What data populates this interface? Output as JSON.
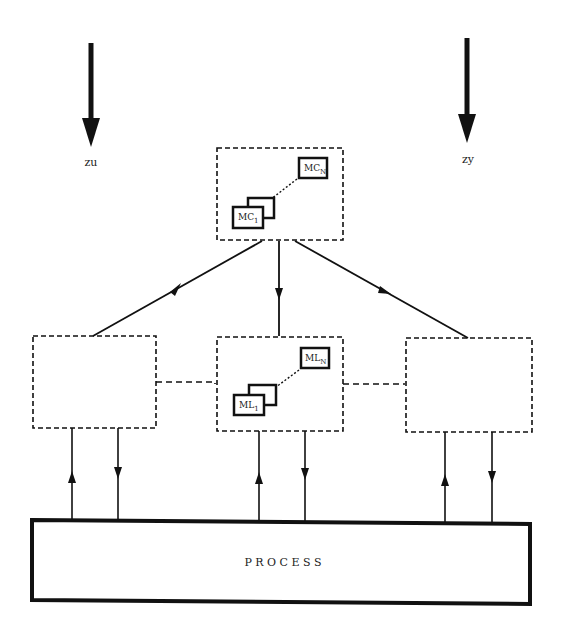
{
  "diagram": {
    "type": "hierarchical control architecture",
    "inputs": {
      "left": {
        "label": "zu"
      },
      "right": {
        "label": "zy"
      }
    },
    "coordinator": {
      "modules": {
        "first": "MC",
        "first_sub": "1",
        "last": "MC",
        "last_sub": "N"
      }
    },
    "local_controllers": [
      {
        "id": "left",
        "modules": null
      },
      {
        "id": "center",
        "modules": {
          "first": "ML",
          "first_sub": "1",
          "last": "ML",
          "last_sub": "N"
        }
      },
      {
        "id": "right",
        "modules": null
      }
    ],
    "process": {
      "label": "P R O C E S S"
    },
    "colors": {
      "line": "#111111",
      "background": "#ffffff"
    }
  }
}
